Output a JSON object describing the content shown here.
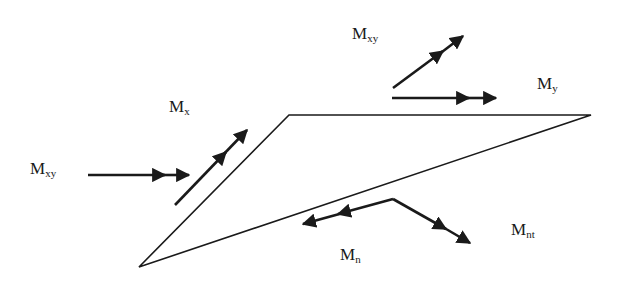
{
  "diagram": {
    "type": "plate-element-moment-diagram",
    "stroke_color": "#1a1a1a",
    "background": "#ffffff",
    "element": {
      "shape": "triangle",
      "vertices": [
        [
          289,
          115
        ],
        [
          591,
          115
        ],
        [
          139,
          267
        ]
      ]
    },
    "labels": {
      "mxy_left": {
        "main": "M",
        "sub": "xy"
      },
      "mx": {
        "main": "M",
        "sub": "x"
      },
      "mxy_top": {
        "main": "M",
        "sub": "xy"
      },
      "my": {
        "main": "M",
        "sub": "y"
      },
      "mn": {
        "main": "M",
        "sub": "n"
      },
      "mnt": {
        "main": "M",
        "sub": "nt"
      }
    },
    "vectors": [
      {
        "id": "mxy-left-vector",
        "label": "M_xy",
        "from": [
          88,
          175
        ],
        "to": [
          189,
          175
        ],
        "heads": 2
      },
      {
        "id": "mx-vector",
        "label": "M_x",
        "from": [
          175,
          205
        ],
        "to": [
          247,
          130
        ],
        "heads": 2
      },
      {
        "id": "mxy-top-vector",
        "label": "M_xy",
        "from": [
          393,
          88
        ],
        "to": [
          463,
          36
        ],
        "heads": 2
      },
      {
        "id": "my-vector",
        "label": "M_y",
        "from": [
          392,
          98
        ],
        "to": [
          496,
          98
        ],
        "heads": 2
      },
      {
        "id": "mn-vector",
        "label": "M_n",
        "from": [
          393,
          199
        ],
        "to": [
          303,
          224
        ],
        "heads": 2
      },
      {
        "id": "mnt-vector",
        "label": "M_nt",
        "from": [
          393,
          199
        ],
        "to": [
          470,
          243
        ],
        "heads": 2
      }
    ]
  }
}
